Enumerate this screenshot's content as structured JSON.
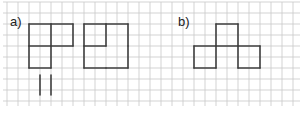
{
  "labels": {
    "a": "a)",
    "b": "b)"
  },
  "colors": {
    "grid": "#c8c8c8",
    "stick": "#404040",
    "background": "#ffffff"
  },
  "grid": {
    "spacing_px": 11,
    "x_start": 7,
    "x_end": 296,
    "y_start": 2,
    "y_end": 106
  },
  "figures": {
    "a_left": {
      "description": "matchstick figure of 3 squares (L-shape: two on top, one bottom-left)"
    },
    "a_right": {
      "description": "matchstick figure: large square with inner partition forming smaller square top-left"
    },
    "a_loose_sticks": {
      "count": 2,
      "orientation": "vertical"
    },
    "b": {
      "description": "matchstick figure of 3 squares: one on top center, two below left and right"
    }
  }
}
